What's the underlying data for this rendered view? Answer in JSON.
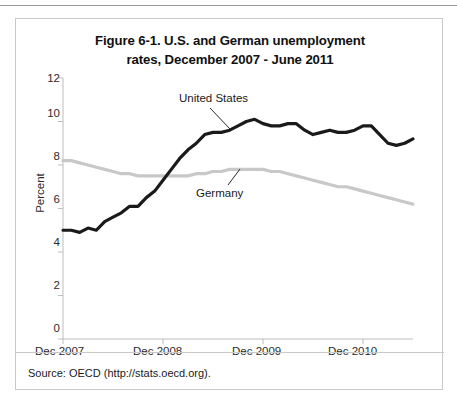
{
  "figure": {
    "title_line1": "Figure 6-1. U.S. and German unemployment",
    "title_line2": "rates, December 2007 - June 2011",
    "source": "Source: OECD (http://stats.oecd.org)."
  },
  "colors": {
    "united_states_line": "#1a1a1a",
    "germany_line": "#c8c8c8",
    "axis": "#bdbdbd",
    "text": "#1a1a1a",
    "panel_border": "#c9c9c9"
  },
  "axis": {
    "y_title": "Percent",
    "y_ticks": [
      "0",
      "2",
      "4",
      "6",
      "8",
      "10",
      "12"
    ],
    "x_ticks": [
      "Dec 2007",
      "Dec 2008",
      "Dec 2009",
      "Dec 2010"
    ]
  },
  "annotations": {
    "united_states": "United States",
    "germany": "Germany"
  },
  "chart_data": {
    "type": "line",
    "title": "Figure 6-1. U.S. and German unemployment rates, December 2007 - June 2011",
    "xlabel": "",
    "ylabel": "Percent",
    "ylim": [
      0,
      12
    ],
    "ytick_step": 2,
    "grid": false,
    "legend": "inline-annotations",
    "x_tick_labels": [
      "Dec 2007",
      "Dec 2008",
      "Dec 2009",
      "Dec 2010"
    ],
    "x_tick_months": [
      0,
      12,
      24,
      36
    ],
    "x_range_months": [
      0,
      42
    ],
    "x_months": [
      0,
      1,
      2,
      3,
      4,
      5,
      6,
      7,
      8,
      9,
      10,
      11,
      12,
      13,
      14,
      15,
      16,
      17,
      18,
      19,
      20,
      21,
      22,
      23,
      24,
      25,
      26,
      27,
      28,
      29,
      30,
      31,
      32,
      33,
      34,
      35,
      36,
      37,
      38,
      39,
      40,
      41,
      42
    ],
    "series": [
      {
        "name": "United States",
        "color": "#1a1a1a",
        "values": [
          5.0,
          5.0,
          4.9,
          5.1,
          5.0,
          5.4,
          5.6,
          5.8,
          6.1,
          6.1,
          6.5,
          6.8,
          7.3,
          7.8,
          8.3,
          8.7,
          9.0,
          9.4,
          9.5,
          9.5,
          9.6,
          9.8,
          10.0,
          10.1,
          9.9,
          9.8,
          9.8,
          9.9,
          9.9,
          9.6,
          9.4,
          9.5,
          9.6,
          9.5,
          9.5,
          9.6,
          9.8,
          9.8,
          9.4,
          9.0,
          8.9,
          9.0,
          9.2
        ]
      },
      {
        "name": "Germany",
        "color": "#c8c8c8",
        "values": [
          8.2,
          8.2,
          8.1,
          8.0,
          7.9,
          7.8,
          7.7,
          7.6,
          7.6,
          7.5,
          7.5,
          7.5,
          7.5,
          7.5,
          7.5,
          7.5,
          7.6,
          7.6,
          7.7,
          7.7,
          7.8,
          7.8,
          7.8,
          7.8,
          7.8,
          7.7,
          7.7,
          7.6,
          7.5,
          7.4,
          7.3,
          7.2,
          7.1,
          7.0,
          7.0,
          6.9,
          6.8,
          6.7,
          6.6,
          6.5,
          6.4,
          6.3,
          6.2
        ]
      }
    ]
  }
}
